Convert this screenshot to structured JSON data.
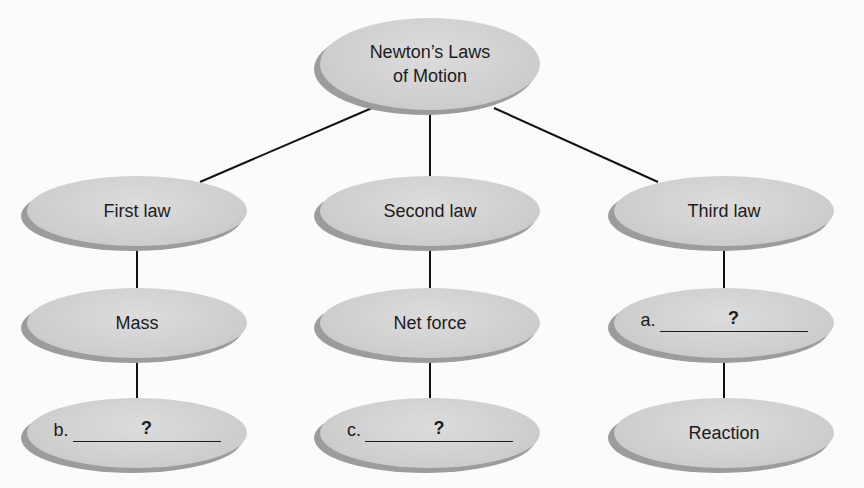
{
  "diagram": {
    "type": "concept-map",
    "root": {
      "label_line1": "Newton’s Laws",
      "label_line2": "of Motion"
    },
    "branches": [
      {
        "label": "First law",
        "children": [
          {
            "label": "Mass"
          },
          {
            "prefix": "b.",
            "blank": "?"
          }
        ]
      },
      {
        "label": "Second law",
        "children": [
          {
            "label": "Net force"
          },
          {
            "prefix": "c.",
            "blank": "?"
          }
        ]
      },
      {
        "label": "Third law",
        "children": [
          {
            "prefix": "a.",
            "blank": "?"
          },
          {
            "label": "Reaction"
          }
        ]
      }
    ],
    "colors": {
      "node_fill": "#d3d3d3",
      "node_shadow": "#9c9c9c",
      "line": "#111111",
      "text": "#1c1c1c"
    }
  }
}
